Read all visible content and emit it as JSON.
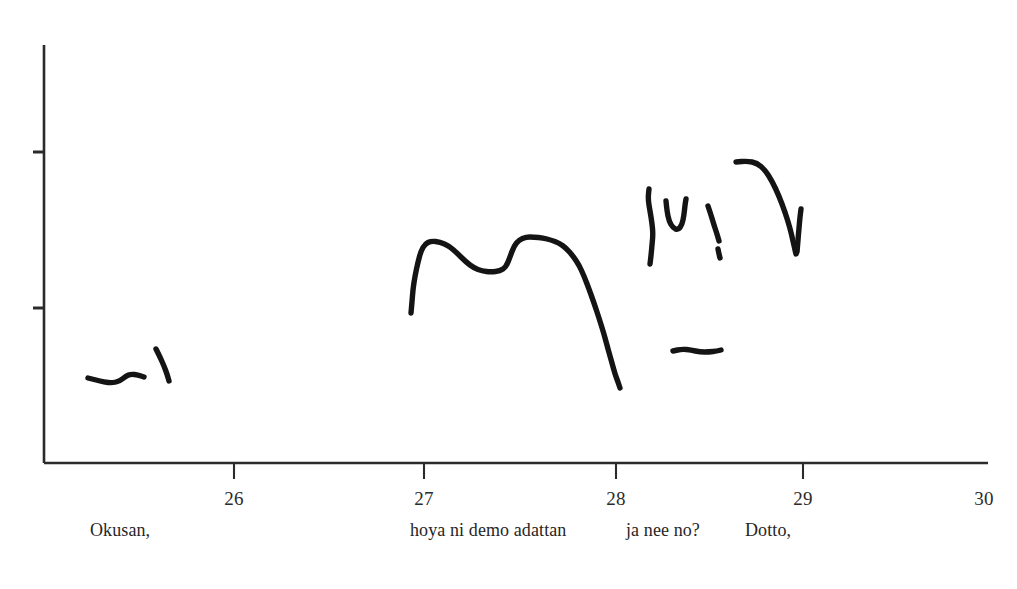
{
  "figure": {
    "background_color": "#ffffff",
    "ink_color": "#141414",
    "axis_color": "#2b2b2b",
    "width": 1017,
    "height": 589
  },
  "chart_data": {
    "type": "line",
    "title": "",
    "xlabel": "",
    "ylabel": "",
    "xlim": [
      25.3,
      30.1
    ],
    "ylim": [
      0,
      10
    ],
    "grid": false,
    "legend": null,
    "x_ticks": [
      {
        "value": 26,
        "label": "26",
        "px": 234
      },
      {
        "value": 27,
        "label": "27",
        "px": 424
      },
      {
        "value": 28,
        "label": "28",
        "px": 616
      },
      {
        "value": 29,
        "label": "29",
        "px": 803
      },
      {
        "value": 30,
        "label": "30",
        "px": 984
      }
    ],
    "y_ticks": [
      {
        "label": "",
        "px": 152
      },
      {
        "label": "",
        "px": 308
      }
    ],
    "axes": {
      "x_axis_y_px": 463,
      "x_axis_x_start_px": 44,
      "x_axis_x_end_px": 988,
      "y_axis_x_px": 44,
      "y_axis_y_top_px": 45,
      "y_axis_y_bottom_px": 463
    },
    "annotations": [
      {
        "text": "Okusan,",
        "x_px": 90,
        "y_px": 534
      },
      {
        "text": "hoya ni demo adattan",
        "x_px": 410,
        "y_px": 534
      },
      {
        "text": "ja nee no?",
        "x_px": 626,
        "y_px": 534
      },
      {
        "text": "Dotto,",
        "x_px": 745,
        "y_px": 534
      }
    ],
    "series": [
      {
        "name": "f0-segment-1",
        "points": [
          [
            88,
            378
          ],
          [
            96,
            380
          ],
          [
            104,
            382
          ],
          [
            112,
            383
          ],
          [
            120,
            381
          ],
          [
            126,
            376
          ],
          [
            131,
            374
          ],
          [
            138,
            375
          ],
          [
            144,
            377
          ]
        ]
      },
      {
        "name": "f0-segment-2",
        "points": [
          [
            156,
            349
          ],
          [
            160,
            357
          ],
          [
            164,
            366
          ],
          [
            167,
            374
          ],
          [
            169,
            381
          ]
        ]
      },
      {
        "name": "f0-segment-3",
        "points": [
          [
            411,
            313
          ],
          [
            412,
            302
          ],
          [
            413,
            289
          ],
          [
            415,
            276
          ],
          [
            418,
            262
          ],
          [
            421,
            251
          ],
          [
            425,
            244
          ],
          [
            431,
            241
          ],
          [
            440,
            242
          ],
          [
            449,
            246
          ],
          [
            457,
            253
          ],
          [
            466,
            262
          ],
          [
            474,
            268
          ],
          [
            482,
            271
          ],
          [
            491,
            272
          ],
          [
            500,
            271
          ],
          [
            506,
            267
          ],
          [
            510,
            257
          ],
          [
            514,
            246
          ],
          [
            519,
            240
          ],
          [
            526,
            237
          ],
          [
            534,
            237
          ],
          [
            543,
            238
          ],
          [
            551,
            240
          ],
          [
            559,
            243
          ],
          [
            566,
            248
          ],
          [
            573,
            256
          ],
          [
            579,
            265
          ],
          [
            584,
            276
          ],
          [
            589,
            289
          ],
          [
            594,
            303
          ],
          [
            599,
            318
          ],
          [
            604,
            334
          ],
          [
            608,
            349
          ],
          [
            612,
            363
          ],
          [
            615,
            374
          ],
          [
            618,
            382
          ],
          [
            620,
            388
          ]
        ]
      },
      {
        "name": "f0-segment-4",
        "points": [
          [
            649,
            189
          ],
          [
            648,
            199
          ],
          [
            650,
            211
          ],
          [
            652,
            223
          ],
          [
            653,
            234
          ],
          [
            652,
            245
          ],
          [
            651,
            256
          ],
          [
            650,
            264
          ]
        ]
      },
      {
        "name": "f0-segment-5",
        "points": [
          [
            666,
            201
          ],
          [
            667,
            211
          ],
          [
            669,
            221
          ],
          [
            673,
            228
          ],
          [
            678,
            230
          ],
          [
            682,
            225
          ],
          [
            684,
            215
          ],
          [
            685,
            205
          ],
          [
            686,
            199
          ]
        ]
      },
      {
        "name": "f0-segment-6",
        "points": [
          [
            708,
            206
          ],
          [
            711,
            215
          ],
          [
            714,
            225
          ],
          [
            717,
            234
          ],
          [
            719,
            241
          ]
        ]
      },
      {
        "name": "f0-segment-7",
        "points": [
          [
            718,
            249
          ],
          [
            719,
            254
          ],
          [
            720,
            258
          ]
        ]
      },
      {
        "name": "f0-segment-8",
        "points": [
          [
            736,
            162
          ],
          [
            747,
            161
          ],
          [
            757,
            163
          ],
          [
            765,
            170
          ],
          [
            772,
            181
          ],
          [
            779,
            196
          ],
          [
            785,
            212
          ],
          [
            790,
            228
          ],
          [
            793,
            241
          ],
          [
            795,
            250
          ],
          [
            796,
            254
          ]
        ]
      },
      {
        "name": "f0-segment-9",
        "points": [
          [
            797,
            252
          ],
          [
            798,
            240
          ],
          [
            799,
            228
          ],
          [
            800,
            217
          ],
          [
            801,
            209
          ]
        ]
      },
      {
        "name": "f0-segment-10",
        "points": [
          [
            673,
            351
          ],
          [
            682,
            349
          ],
          [
            691,
            350
          ],
          [
            700,
            352
          ],
          [
            709,
            352
          ],
          [
            717,
            351
          ],
          [
            721,
            350
          ]
        ]
      }
    ]
  }
}
